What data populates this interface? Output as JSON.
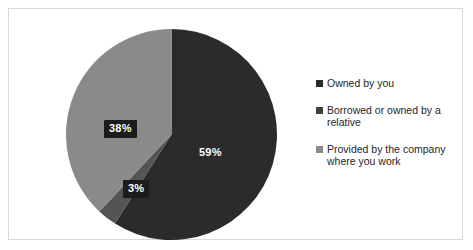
{
  "chart_data": {
    "type": "pie",
    "title": "",
    "categories": [
      "Owned by you",
      "Borrowed or owned by a relative",
      "Provided by the company where you work"
    ],
    "values": [
      59,
      3,
      38
    ],
    "value_labels": [
      "59%",
      "3%",
      "38%"
    ],
    "colors": [
      "#2b2b2b",
      "#545454",
      "#8a8a8a"
    ],
    "legend_position": "right",
    "grid": false,
    "start_angle_deg": 0,
    "direction": "clockwise",
    "units": "percent"
  },
  "chart": {
    "slices": [
      {
        "name": "owned-by-you",
        "label": "59%",
        "value": 59,
        "color": "#2b2b2b",
        "boxed": false
      },
      {
        "name": "borrowed-or-owned-by-relative",
        "label": "3%",
        "value": 3,
        "color": "#545454",
        "boxed": true
      },
      {
        "name": "provided-by-company",
        "label": "38%",
        "value": 38,
        "color": "#8a8a8a",
        "boxed": true
      }
    ]
  },
  "legend": {
    "items": [
      {
        "label": "Owned by you",
        "color": "#2b2b2b"
      },
      {
        "label": "Borrowed or owned by a relative",
        "color": "#3f3f3f"
      },
      {
        "label": "Provided by the company where you work",
        "color": "#8a8a8a"
      }
    ]
  },
  "colors": {
    "background": "#ffffff",
    "frame_border": "#d9d9d9",
    "label_box": "#1c1c1c",
    "label_text": "#ffffff",
    "legend_text": "#262626"
  }
}
